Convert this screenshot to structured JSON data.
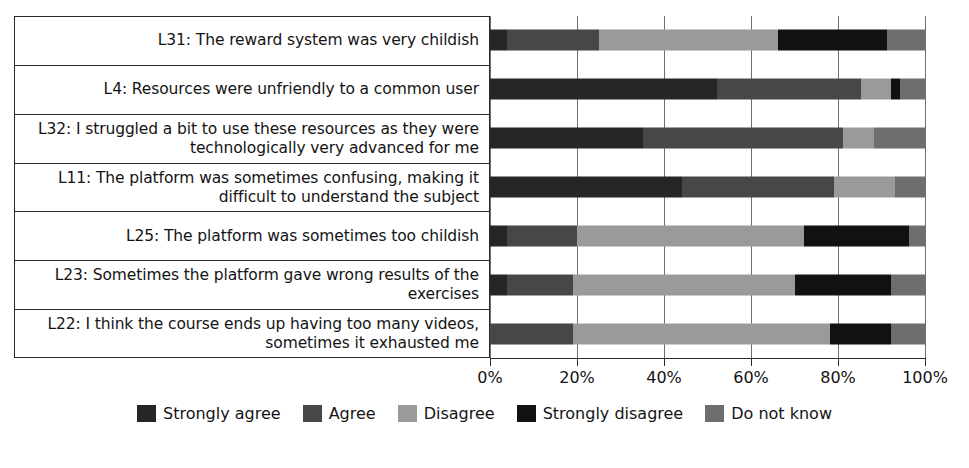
{
  "chart_data": {
    "type": "bar",
    "orientation": "horizontal",
    "stacked": true,
    "stack_mode": "percent",
    "title": "",
    "xlabel": "",
    "ylabel": "",
    "xlim": [
      0,
      100
    ],
    "xticks": [
      "0%",
      "20%",
      "40%",
      "60%",
      "80%",
      "100%"
    ],
    "xtick_values": [
      0,
      20,
      40,
      60,
      80,
      100
    ],
    "grid": true,
    "legend_position": "bottom",
    "categories": [
      "L31: The reward system was very childish",
      "L4: Resources were unfriendly to a common user",
      "L32: I struggled a bit to use these resources as they were technologically very advanced for me",
      "L11: The platform was sometimes confusing, making it difficult to understand the subject",
      "L25: The platform was sometimes too childish",
      "L23: Sometimes the platform gave wrong results of the exercises",
      "L22: I think the course ends up having too many videos, sometimes it exhausted me"
    ],
    "series": [
      {
        "name": "Strongly agree",
        "color": "#262626",
        "values": [
          4,
          52,
          35,
          44,
          4,
          4,
          0
        ]
      },
      {
        "name": "Agree",
        "color": "#474747",
        "values": [
          21,
          33,
          46,
          35,
          16,
          15,
          19
        ]
      },
      {
        "name": "Disagree",
        "color": "#9a9a9a",
        "values": [
          41,
          7,
          7,
          14,
          52,
          51,
          59
        ]
      },
      {
        "name": "Strongly disagree",
        "color": "#111111",
        "values": [
          25,
          2,
          0,
          0,
          24,
          22,
          14
        ]
      },
      {
        "name": "Do not know",
        "color": "#6e6e6e",
        "values": [
          9,
          6,
          12,
          7,
          4,
          8,
          8
        ]
      }
    ]
  },
  "legend": {
    "items": [
      {
        "label": "Strongly agree"
      },
      {
        "label": "Agree"
      },
      {
        "label": "Disagree"
      },
      {
        "label": "Strongly disagree"
      },
      {
        "label": "Do not know"
      }
    ]
  }
}
